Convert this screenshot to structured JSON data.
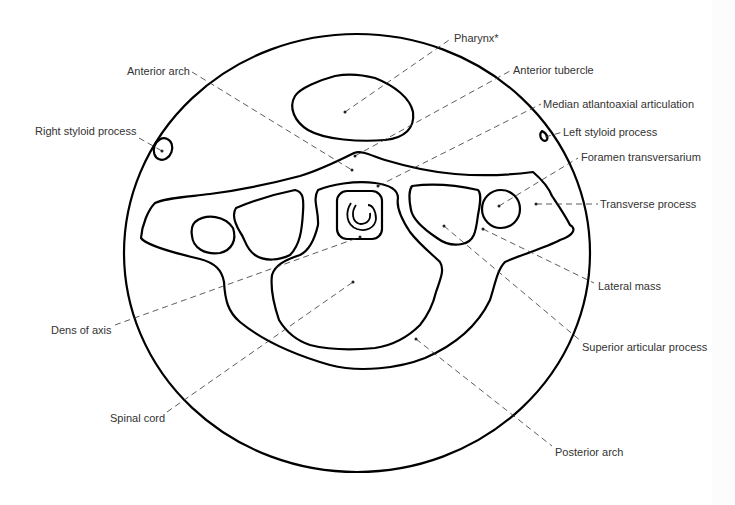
{
  "labels": [
    {
      "id": "pharynx",
      "text": "Pharynx*"
    },
    {
      "id": "anterior-arch",
      "text": "Anterior arch"
    },
    {
      "id": "anterior-tubercle",
      "text": "Anterior tubercle"
    },
    {
      "id": "median-atlantoaxial-articulation",
      "text": "Median atlantoaxial articulation"
    },
    {
      "id": "right-styloid-process",
      "text": "Right styloid process"
    },
    {
      "id": "left-styloid-process",
      "text": "Left styloid process"
    },
    {
      "id": "foramen-transversarium",
      "text": "Foramen transversarium"
    },
    {
      "id": "transverse-process",
      "text": "Transverse process"
    },
    {
      "id": "lateral-mass",
      "text": "Lateral mass"
    },
    {
      "id": "dens-of-axis",
      "text": "Dens of axis"
    },
    {
      "id": "superior-articular-process",
      "text": "Superior articular process"
    },
    {
      "id": "spinal-cord",
      "text": "Spinal cord"
    },
    {
      "id": "posterior-arch",
      "text": "Posterior arch"
    }
  ]
}
